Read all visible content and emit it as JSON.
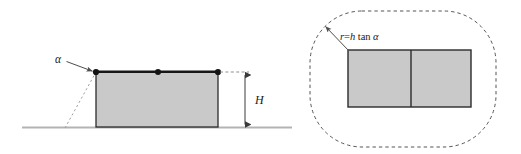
{
  "figure": {
    "name": "two-panel-geometry-diagram",
    "background_color": "#ffffff",
    "width": 521,
    "height": 154
  },
  "style": {
    "block_fill": "#c9c9c9",
    "block_stroke": "#2b2b2b",
    "ground_color": "#b3b3b3",
    "line_color": "#4d4d4d",
    "dot_color": "#141414",
    "text_color": "#1a1a1a",
    "dashed_color": "#9a9a9a",
    "dotted_boundary_color": "#555555"
  },
  "left_panel": {
    "name": "elevation-view",
    "labels": {
      "angle": "α",
      "height": "H"
    },
    "block": {
      "x": 96,
      "y": 72,
      "width": 122,
      "height": 55
    },
    "ground": {
      "x1": 22,
      "x2": 292,
      "y": 127
    },
    "top_nodes": [
      {
        "name": "node-left",
        "x": 96,
        "y": 72
      },
      {
        "name": "node-middle",
        "x": 158,
        "y": 72
      },
      {
        "name": "node-right",
        "x": 218,
        "y": 72
      }
    ],
    "angle_ray": {
      "from_x": 65,
      "from_y": 128,
      "to_x": 96,
      "to_y": 72
    },
    "angle_leader": {
      "from_x": 66,
      "from_y": 61,
      "to_x": 93,
      "to_y": 72
    },
    "dimension": {
      "x": 245,
      "top_y": 72,
      "bottom_y": 127,
      "leader_from_x": 220,
      "leader_to_x": 248,
      "label_x": 252,
      "label_y": 103
    }
  },
  "right_panel": {
    "name": "plan-view",
    "labels": {
      "radius_formula": "r=h tan α",
      "radius_formula_parts": {
        "variable": "r",
        "equals": "=",
        "height_symbol": "h",
        "function": "tan",
        "angle": "α"
      }
    },
    "boundary": {
      "x": 310,
      "y": 11,
      "width": 186,
      "height": 136,
      "corner_radius": 52,
      "dash_pattern": "3 4"
    },
    "block": {
      "x": 348,
      "y": 50,
      "width": 123,
      "height": 57,
      "divider_x": 411
    },
    "leader": {
      "from_x": 325,
      "from_y": 26,
      "to_x": 349,
      "to_y": 51,
      "label_x": 341,
      "label_y": 40
    }
  }
}
